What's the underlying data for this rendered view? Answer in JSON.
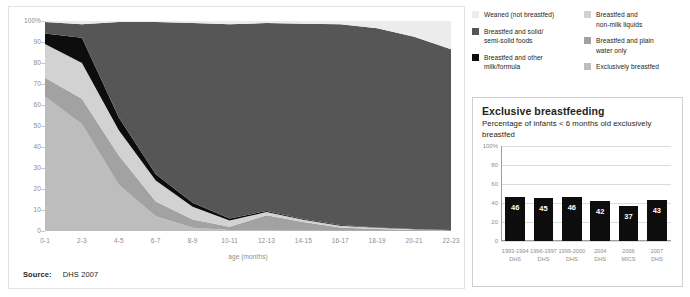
{
  "colors": {
    "weaned": "#ececec",
    "solid_foods": "#565656",
    "other_milk": "#0d0d0d",
    "non_milk_liquids": "#d2d2d2",
    "plain_water": "#a2a2a2",
    "exclusive": "#bdbdbd",
    "bar_fill": "#0d0d0d",
    "axis": "#8d8d8d"
  },
  "legend": {
    "left_items": [
      {
        "label": "Weaned (not breastfed)",
        "color_key": "weaned",
        "icon": "legend-swatch"
      },
      {
        "label": "Breastfed and solid/\nsemi-solid foods",
        "color_key": "solid_foods",
        "icon": "legend-swatch"
      },
      {
        "label": "Breastfed and other\nmilk/formula",
        "color_key": "other_milk",
        "icon": "legend-swatch"
      }
    ],
    "right_items": [
      {
        "label": "Breastfed and\nnon-milk liquids",
        "color_key": "non_milk_liquids",
        "icon": "legend-swatch"
      },
      {
        "label": "Breastfed and plain\nwater only",
        "color_key": "plain_water",
        "icon": "legend-swatch"
      },
      {
        "label": "Exclusively breastfed",
        "color_key": "exclusive",
        "icon": "legend-swatch"
      }
    ]
  },
  "source": {
    "label": "Source:",
    "value": "DHS 2007"
  },
  "bar_panel": {
    "title": "Exclusive breastfeeding",
    "subtitle": "Percentage of infants < 6 months old exclusively breastfed"
  },
  "chart_data": [
    {
      "type": "area",
      "title": "",
      "xlabel": "age (months)",
      "ylabel": "",
      "ylim": [
        0,
        100
      ],
      "grid": true,
      "stacked": true,
      "normalized_percent": true,
      "legend_position": "top-right-external",
      "categories": [
        "0-1",
        "2-3",
        "4-5",
        "6-7",
        "8-9",
        "10-11",
        "12-13",
        "14-15",
        "16-17",
        "18-19",
        "20-21",
        "22-23"
      ],
      "ytick_labels": [
        "0",
        "10",
        "20",
        "30",
        "40",
        "50",
        "60",
        "70",
        "80",
        "90",
        "100%"
      ],
      "ytick_values": [
        0,
        10,
        20,
        30,
        40,
        50,
        60,
        70,
        80,
        90,
        100
      ],
      "series": [
        {
          "name": "Exclusively breastfed",
          "color_key": "exclusive",
          "values": [
            64,
            51,
            22,
            7,
            1.5,
            0.5,
            0.5,
            0.3,
            0.2,
            0.2,
            0.1,
            0
          ]
        },
        {
          "name": "Breastfed and plain water only",
          "color_key": "plain_water",
          "values": [
            9,
            12,
            14,
            7,
            4,
            1.5,
            7,
            4,
            1.5,
            0.8,
            0.4,
            0.2
          ]
        },
        {
          "name": "Breastfed and non-milk liquids",
          "color_key": "non_milk_liquids",
          "values": [
            16,
            17,
            12,
            10,
            6,
            3,
            1.5,
            1,
            0.8,
            0.5,
            0.3,
            0.2
          ]
        },
        {
          "name": "Breastfed and other milk/formula",
          "color_key": "other_milk",
          "values": [
            5,
            12,
            6,
            3,
            2,
            1,
            0.5,
            0.4,
            0.3,
            0.2,
            0.2,
            0.1
          ]
        },
        {
          "name": "Breastfed and solid/semi-solid foods",
          "color_key": "solid_foods",
          "values": [
            5.5,
            6.5,
            45.5,
            72.5,
            85.5,
            92.5,
            89.5,
            93,
            95.7,
            94.8,
            91.5,
            86
          ]
        },
        {
          "name": "Weaned (not breastfed)",
          "color_key": "weaned",
          "values": [
            0.5,
            1.5,
            0.5,
            0.5,
            1,
            1.5,
            1,
            1.3,
            1.5,
            3.5,
            7.5,
            13.5
          ]
        }
      ]
    },
    {
      "type": "bar",
      "title": "Exclusive breastfeeding",
      "subtitle": "Percentage of infants < 6 months old exclusively breastfed",
      "xlabel": "",
      "ylabel": "",
      "ylim": [
        0,
        100
      ],
      "grid": true,
      "categories": [
        "1993-1994\nDHS",
        "1996-1997\nDHS",
        "1999-2000\nDHS",
        "2004\nDHS",
        "2006\nMICS",
        "2007\nDHS"
      ],
      "values": [
        46,
        45,
        46,
        42,
        37,
        43
      ],
      "data_labels": [
        "46",
        "45",
        "46",
        "42",
        "37",
        "43"
      ],
      "ytick_labels": [
        "0",
        "20",
        "40",
        "60",
        "80",
        "100%"
      ],
      "ytick_values": [
        0,
        20,
        40,
        60,
        80,
        100
      ]
    }
  ]
}
